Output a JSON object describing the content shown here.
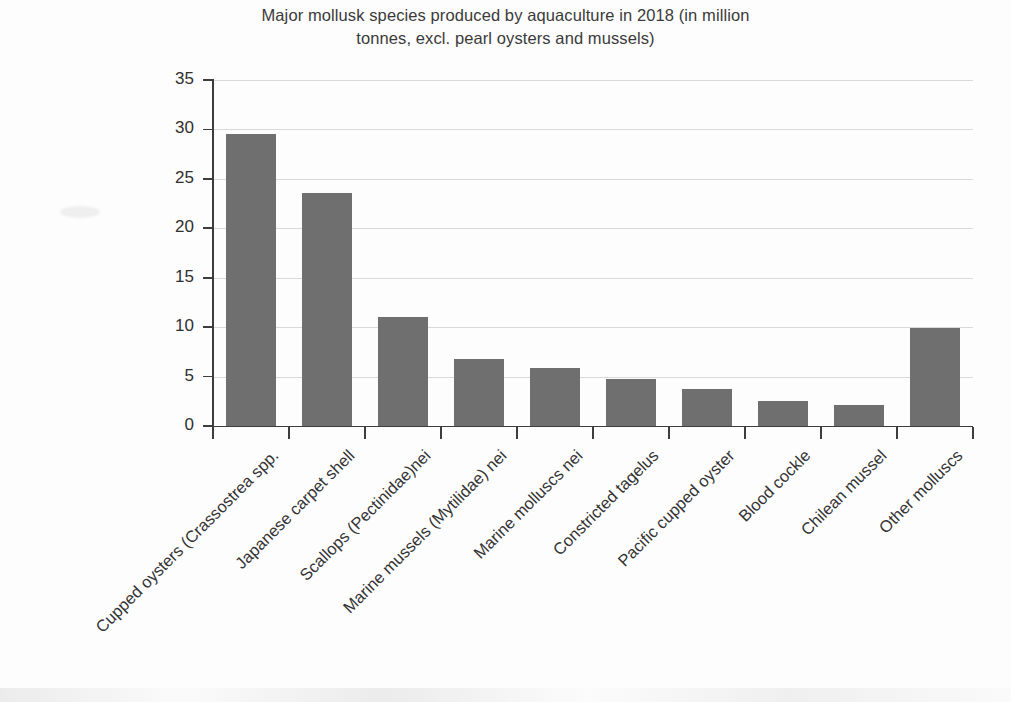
{
  "chart_data": {
    "type": "bar",
    "title": "Major mollusk species produced by aquaculture in 2018 (in million tonnes, excl. pearl oysters and mussels)",
    "title_line_1": "Major mollusk species produced by aquaculture in 2018 (in million",
    "title_line_2": "tonnes, excl. pearl oysters and mussels)",
    "xlabel": "",
    "ylabel": "",
    "categories": [
      "Cupped oysters (Crassostrea spp.",
      "Japanese carpet shell",
      "Scallops (Pectinidae)nei",
      "Marine mussels (Mytilidae) nei",
      "Marine molluscs nei",
      "Constricted tagelus",
      "Pacific cupped oyster",
      "Blood cockle",
      "Chilean mussel",
      "Other molluscs"
    ],
    "values": [
      29.5,
      23.6,
      11.0,
      6.8,
      5.9,
      4.8,
      3.7,
      2.5,
      2.1,
      9.9
    ],
    "ylim": [
      0,
      35
    ],
    "ytick_values": [
      0,
      5,
      10,
      15,
      20,
      25,
      30,
      35
    ],
    "ytick_labels": [
      "0",
      "5",
      "10",
      "15",
      "20",
      "25",
      "30",
      "35"
    ],
    "grid": "horizontal",
    "legend": "none",
    "bar_color": "#6f6f6f",
    "grid_color": "#d9d9d9",
    "axis_color": "#3d3d3d",
    "background_color": "#fdfdfd"
  }
}
